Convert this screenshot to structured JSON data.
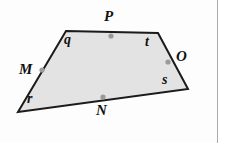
{
  "figure": {
    "shape_type": "quadrilateral",
    "fill_color": "#e3e3e3",
    "stroke_color": "#1b1b1b",
    "stroke_width": 2,
    "dot_color": "#9a9a9a",
    "background_color": "#ffffff",
    "card_border_color": "#a9a9ad",
    "vertices": [
      {
        "name": "top-left",
        "x": 66,
        "y": 31
      },
      {
        "name": "top-right",
        "x": 158,
        "y": 33
      },
      {
        "name": "bottom-right",
        "x": 188,
        "y": 89
      },
      {
        "name": "bottom-left",
        "x": 18,
        "y": 112
      }
    ],
    "points": [
      {
        "label": "P",
        "x": 111,
        "y": 36,
        "label_x": 110,
        "label_y": 16,
        "dot": true
      },
      {
        "label": "O",
        "x": 168,
        "y": 62,
        "label_x": 178,
        "label_y": 56,
        "dot": true
      },
      {
        "label": "M",
        "x": 42,
        "y": 70,
        "label_x": 22,
        "label_y": 63,
        "dot": true
      },
      {
        "label": "N",
        "x": 103,
        "y": 97,
        "label_x": 98,
        "label_y": 104,
        "dot": true
      }
    ],
    "segment_labels": [
      {
        "label": "q",
        "x": 68,
        "y": 38
      },
      {
        "label": "t",
        "x": 148,
        "y": 39
      },
      {
        "label": "s",
        "x": 166,
        "y": 77
      },
      {
        "label": "r",
        "x": 29,
        "y": 96
      }
    ]
  }
}
